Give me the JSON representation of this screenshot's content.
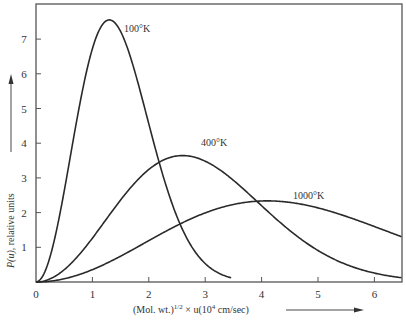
{
  "chart_data": {
    "type": "line",
    "title": "",
    "xlabel": "(Mol. wt.)^1/2 × u(10^4 cm/sec)",
    "ylabel": "P(u), relative units",
    "xlim": [
      0,
      6.5
    ],
    "ylim": [
      0,
      7.8
    ],
    "x_ticks": [
      0,
      1,
      2,
      3,
      4,
      5,
      6
    ],
    "y_ticks": [
      1,
      2,
      3,
      4,
      5,
      6,
      7
    ],
    "grid": false,
    "legend": "inline labels near curves",
    "series": [
      {
        "name": "100°K",
        "label_pos": [
          1.95,
          7.4
        ],
        "x": [
          0,
          0.25,
          0.5,
          0.75,
          1.0,
          1.25,
          1.5,
          1.75,
          2.0,
          2.25,
          2.5,
          2.75,
          3.0,
          3.25,
          3.5
        ],
        "y": [
          0,
          0.66,
          2.32,
          4.33,
          6.04,
          7.03,
          7.18,
          6.6,
          5.54,
          4.27,
          3.04,
          2.0,
          1.22,
          0.69,
          0.36
        ]
      },
      {
        "name": "400°K",
        "label_pos": [
          2.55,
          4.05
        ],
        "x": [
          0,
          0.5,
          1.0,
          1.5,
          2.0,
          2.5,
          3.0,
          3.5,
          4.0,
          4.5,
          5.0,
          5.5,
          6.0,
          6.5
        ],
        "y": [
          0,
          0.3,
          1.08,
          2.03,
          2.9,
          3.45,
          3.59,
          3.35,
          2.84,
          2.21,
          1.59,
          1.06,
          0.66,
          0.39
        ]
      },
      {
        "name": "1000°K",
        "label_pos": [
          4.6,
          2.45
        ],
        "x": [
          0,
          0.5,
          1.0,
          1.5,
          2.0,
          2.5,
          3.0,
          3.5,
          4.0,
          4.5,
          5.0,
          5.5,
          6.0,
          6.5
        ],
        "y": [
          0,
          0.12,
          0.45,
          0.92,
          1.42,
          1.87,
          2.18,
          2.32,
          2.29,
          2.12,
          1.86,
          1.55,
          1.23,
          0.94
        ]
      }
    ]
  },
  "labels": {
    "curve_100": "100°K",
    "curve_400": "400°K",
    "curve_1000": "1000°K",
    "x_axis_main": "(Mol. wt.)",
    "x_axis_sup": "1/2",
    "x_axis_rest": " × u(10",
    "x_axis_sup2": "4",
    "x_axis_unit": " cm/sec)",
    "y_axis_italic": "P(u)",
    "y_axis_rest": ", relative units"
  },
  "colors": {
    "curve": "#2a2a2a",
    "axis": "#555555",
    "background": "#ffffff"
  }
}
